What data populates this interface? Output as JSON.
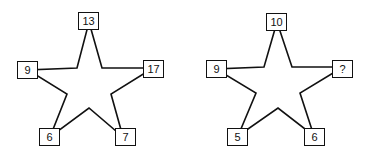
{
  "puzzle": {
    "star_left": {
      "top": "13",
      "left": "9",
      "right": "17",
      "bottom_left": "6",
      "bottom_right": "7"
    },
    "star_right": {
      "top": "10",
      "left": "9",
      "right": "?",
      "bottom_left": "5",
      "bottom_right": "6"
    }
  },
  "colors": {
    "stroke": "#111111",
    "background": "#ffffff"
  }
}
